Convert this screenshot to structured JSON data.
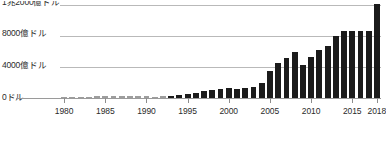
{
  "chart_data": {
    "type": "bar",
    "title": "",
    "subtitle": "",
    "xlabel": "",
    "ylabel": "",
    "ylim": [
      0,
      1260
    ],
    "xlim": [
      1980,
      2018
    ],
    "grid": true,
    "legend": false,
    "legend_position": "none",
    "unit_note": "億ドル (hundreds of millions of USD)",
    "bar_color": "#1b1b1b",
    "gridline_color": "#b9b9b9",
    "axis_color": "#9a9a9a",
    "text_color": "#2b2b2b",
    "ytick_labels": [
      "0ドル",
      "4000億ドル",
      "8000億ドル",
      "1兆2000億ドル"
    ],
    "ytick_values": [
      0,
      400,
      800,
      1200
    ],
    "ytick_top_clipped": true,
    "xtick_labels": [
      "1980",
      "1985",
      "1990",
      "1995",
      "2000",
      "2005",
      "2010",
      "2015",
      "2018"
    ],
    "xtick_values": [
      1980,
      1985,
      1990,
      1995,
      2000,
      2005,
      2010,
      2015,
      2018
    ],
    "categories": [
      "1980",
      "1981",
      "1982",
      "1983",
      "1984",
      "1985",
      "1986",
      "1987",
      "1988",
      "1989",
      "1990",
      "1991",
      "1992",
      "1993",
      "1994",
      "1995",
      "1996",
      "1997",
      "1998",
      "1999",
      "2000",
      "2001",
      "2002",
      "2003",
      "2004",
      "2005",
      "2006",
      "2007",
      "2008",
      "2009",
      "2010",
      "2011",
      "2012",
      "2013",
      "2014",
      "2015",
      "2016",
      "2017",
      "2018"
    ],
    "values": [
      8,
      10,
      12,
      14,
      22,
      25,
      26,
      28,
      27,
      25,
      22,
      16,
      23,
      32,
      43,
      55,
      70,
      85,
      100,
      115,
      125,
      120,
      125,
      145,
      190,
      350,
      460,
      520,
      600,
      430,
      530,
      620,
      680,
      810,
      880,
      870,
      870,
      880,
      1230
    ],
    "early_bars_faded_through": 1992
  }
}
